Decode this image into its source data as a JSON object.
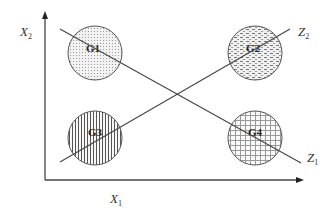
{
  "diagram": {
    "axes": {
      "x": {
        "label": "X",
        "subscript": "1"
      },
      "y": {
        "label": "X",
        "subscript": "2"
      }
    },
    "lines": [
      {
        "id": "z1",
        "label": "Z",
        "subscript": "1"
      },
      {
        "id": "z2",
        "label": "Z",
        "subscript": "2"
      }
    ],
    "groups": [
      {
        "id": "g1",
        "label": "G1",
        "pattern": "dots"
      },
      {
        "id": "g2",
        "label": "G2",
        "pattern": "dashes"
      },
      {
        "id": "g3",
        "label": "G3",
        "pattern": "vertical-lines"
      },
      {
        "id": "g4",
        "label": "G4",
        "pattern": "grid"
      }
    ],
    "colors": {
      "stroke": "#444444",
      "background": "#ffffff"
    }
  }
}
